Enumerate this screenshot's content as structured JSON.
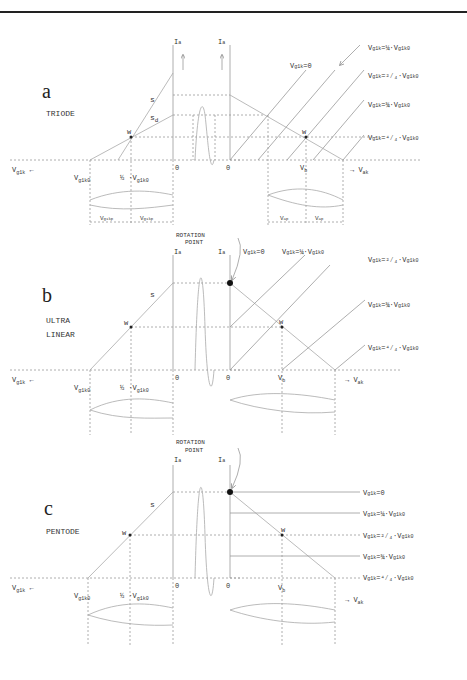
{
  "panels": [
    {
      "letter": "a",
      "title_lines": [
        "TRIODE"
      ],
      "labels": {
        "s": "s",
        "sd": "s",
        "sd_sub": "d",
        "w_left": "w",
        "w_right": "w",
        "vg1k_axis": "V",
        "vg1k_axis_sub": "g1k",
        "vg1k0": "V",
        "vg1k0_sub": "g1k0",
        "half": "1/2 ·V",
        "half_sub": "g1k0",
        "zero_left": "0",
        "zero_right": "0",
        "ia_left": "I",
        "ia_right": "I",
        "ia_sub": "a",
        "iap": "i",
        "iap_sub": "ap",
        "vb": "V",
        "vb_sub": "b",
        "vak": "→ V",
        "vak_sub": "ak",
        "vg1kp": "V",
        "vg1kp_sub": "g1kp",
        "vap": "V",
        "vap_sub": "ap"
      },
      "curve_labels": [
        "Vg1k=0",
        "Vg1k=1/4·Vg1k0",
        "Vg1k=2/4·Vg1k0",
        "Vg1k=3/4·Vg1k0",
        "Vg1k=4/4·Vg1k0"
      ]
    },
    {
      "letter": "b",
      "title_lines": [
        "ULTRA",
        "LINEAR"
      ],
      "rotation_point": [
        "ROTATION",
        "POINT"
      ],
      "curve_labels": [
        "Vg1k=0",
        "Vg1k=1/4·Vg1k0",
        "Vg1k=2/4·Vg1k0",
        "Vg1k=3/4·Vg1k0",
        "Vg1k=4/4·Vg1k0"
      ]
    },
    {
      "letter": "c",
      "title_lines": [
        "PENTODE"
      ],
      "rotation_point": [
        "ROTATION",
        "POINT"
      ],
      "curve_labels": [
        "Vg1k=0",
        "Vg1k=1/4·Vg1k0",
        "Vg1k=2/4·Vg1k0",
        "Vg1k=3/4·Vg1k0",
        "Vg1k=4/4·Vg1k0"
      ]
    }
  ],
  "common": {
    "s": "s",
    "w": "w",
    "zero": "0",
    "I": "I",
    "a": "a",
    "i": "i",
    "ap": "ap",
    "V": "V",
    "g1k": "g1k",
    "g1k0": "g1k0",
    "g1kp": "g1kp",
    "b": "b",
    "ak": "ak",
    "one": "1",
    "two": "2",
    "three": "3",
    "four": "4",
    "eq0": "=0",
    "eq": "=",
    "dot": "·",
    "d": "d"
  }
}
